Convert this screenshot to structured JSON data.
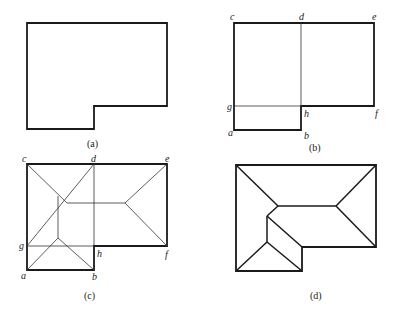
{
  "figure": {
    "panels": [
      {
        "id": "a",
        "caption": "(a)",
        "description": "L-shaped building outline"
      },
      {
        "id": "b",
        "caption": "(b)",
        "description": "Outline divided into rectangles",
        "labels": {
          "c": "c",
          "d": "d",
          "e": "e",
          "f": "f",
          "g": "g",
          "h": "h",
          "a": "a",
          "b": "b"
        }
      },
      {
        "id": "c",
        "caption": "(c)",
        "description": "Hip roof construction lines on rectangles",
        "labels": {
          "c": "c",
          "d": "d",
          "e": "e",
          "f": "f",
          "g": "g",
          "h": "h",
          "a": "a",
          "b": "b"
        }
      },
      {
        "id": "d",
        "caption": "(d)",
        "description": "Final roof plan"
      }
    ],
    "colors": {
      "line": "#1a1a1a",
      "background": "#ffffff"
    }
  }
}
